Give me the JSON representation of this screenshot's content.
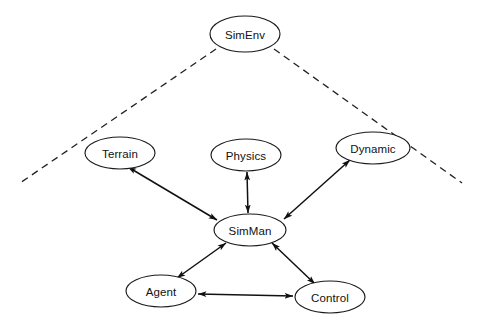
{
  "diagram": {
    "type": "node-link-graph",
    "background_color": "#ffffff",
    "node_fill_color": "#ffffff",
    "node_stroke_color": "#1a1a1a",
    "edge_color": "#111111",
    "dashed_edge_color": "#222222",
    "nodes": [
      {
        "id": "simenv",
        "label": "SimEnv",
        "cx": 245,
        "cy": 34,
        "rx": 35,
        "ry": 18
      },
      {
        "id": "terrain",
        "label": "Terrain",
        "cx": 120,
        "cy": 153,
        "rx": 35,
        "ry": 16
      },
      {
        "id": "physics",
        "label": "Physics",
        "cx": 246,
        "cy": 155,
        "rx": 35,
        "ry": 16
      },
      {
        "id": "dynamic",
        "label": "Dynamic",
        "cx": 373,
        "cy": 148,
        "rx": 37,
        "ry": 16
      },
      {
        "id": "simman",
        "label": "SimMan",
        "cx": 250,
        "cy": 230,
        "rx": 36,
        "ry": 16
      },
      {
        "id": "agent",
        "label": "Agent",
        "cx": 161,
        "cy": 291,
        "rx": 35,
        "ry": 16
      },
      {
        "id": "control",
        "label": "Control",
        "cx": 330,
        "cy": 297,
        "rx": 35,
        "ry": 16
      }
    ],
    "edges": [
      {
        "id": "terrain-simman",
        "from": "terrain",
        "to": "simman",
        "style": "solid",
        "arrows": "both"
      },
      {
        "id": "physics-simman",
        "from": "physics",
        "to": "simman",
        "style": "solid",
        "arrows": "both"
      },
      {
        "id": "dynamic-simman",
        "from": "dynamic",
        "to": "simman",
        "style": "solid",
        "arrows": "both"
      },
      {
        "id": "simman-agent",
        "from": "simman",
        "to": "agent",
        "style": "solid",
        "arrows": "both"
      },
      {
        "id": "simman-control",
        "from": "simman",
        "to": "control",
        "style": "solid",
        "arrows": "both"
      },
      {
        "id": "agent-control",
        "from": "agent",
        "to": "control",
        "style": "solid",
        "arrows": "both"
      },
      {
        "id": "simenv-left",
        "from": "simenv",
        "to": "boundary-left",
        "style": "dashed",
        "arrows": "none"
      },
      {
        "id": "simenv-right",
        "from": "simenv",
        "to": "boundary-right",
        "style": "dashed",
        "arrows": "none"
      }
    ]
  }
}
